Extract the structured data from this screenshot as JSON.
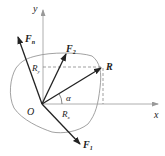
{
  "diagram": {
    "axes": {
      "x_label": "x",
      "y_label": "y",
      "origin_label": "O"
    },
    "vectors": [
      {
        "id": "Fn",
        "label": "F",
        "subscript": "n"
      },
      {
        "id": "F2",
        "label": "F",
        "subscript": "2"
      },
      {
        "id": "R",
        "label": "R",
        "subscript": ""
      },
      {
        "id": "F1",
        "label": "F",
        "subscript": "1"
      }
    ],
    "components": {
      "Rx": {
        "label": "R",
        "subscript": "x"
      },
      "Ry": {
        "label": "R",
        "subscript": "y"
      }
    },
    "angle_label": "α",
    "colors": {
      "line": "#222222",
      "outline": "#8a8a8a",
      "axis": "#9a9a9a"
    }
  }
}
